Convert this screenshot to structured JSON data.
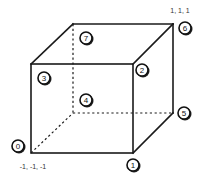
{
  "diagram": {
    "type": "cube-vertex-numbering",
    "vertices": [
      {
        "id": "0",
        "label": "0"
      },
      {
        "id": "1",
        "label": "1"
      },
      {
        "id": "2",
        "label": "2"
      },
      {
        "id": "3",
        "label": "3"
      },
      {
        "id": "4",
        "label": "4"
      },
      {
        "id": "5",
        "label": "5"
      },
      {
        "id": "6",
        "label": "6"
      },
      {
        "id": "7",
        "label": "7"
      }
    ],
    "coordinate_labels": {
      "max_corner": "1, 1, 1",
      "min_corner": "-1, -1, -1"
    }
  }
}
